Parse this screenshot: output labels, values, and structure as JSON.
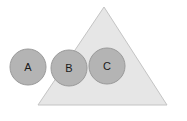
{
  "diagram": {
    "canvas": {
      "width": 187,
      "height": 121,
      "background": "#ffffff"
    },
    "colors": {
      "triangle_fill": "#e6e6e6",
      "triangle_stroke": "#c4c4c4",
      "circle_fill": "#b4b4b4",
      "circle_stroke": "#9a9a9a",
      "label_color": "#1a1a1a"
    },
    "shapes": [
      {
        "id": "triangle",
        "type": "triangle",
        "name": "triangle-shape",
        "label": "",
        "apex_x": 104,
        "apex_y": 7,
        "base_left_x": 38,
        "base_right_x": 167,
        "base_y": 105,
        "fill": "#e6e6e6",
        "stroke": "#c4c4c4"
      },
      {
        "id": "circle-a",
        "type": "circle",
        "name": "circle-a",
        "label": "A",
        "cx": 28,
        "cy": 67,
        "r": 18,
        "fill": "#b4b4b4",
        "stroke": "#9a9a9a"
      },
      {
        "id": "circle-b",
        "type": "circle",
        "name": "circle-b",
        "label": "B",
        "cx": 69,
        "cy": 68,
        "r": 18,
        "fill": "#b4b4b4",
        "stroke": "#9a9a9a"
      },
      {
        "id": "circle-c",
        "type": "circle",
        "name": "circle-c",
        "label": "C",
        "cx": 107,
        "cy": 66,
        "r": 18,
        "fill": "#b4b4b4",
        "stroke": "#9a9a9a"
      }
    ]
  }
}
